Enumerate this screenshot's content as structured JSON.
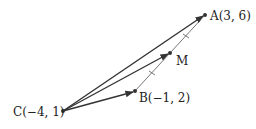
{
  "diagram": {
    "type": "vector-geometry",
    "points": [
      {
        "id": "A",
        "label": "A(3, 6)",
        "coords": [
          3,
          6
        ]
      },
      {
        "id": "B",
        "label": "B(−1, 2)",
        "coords": [
          -1,
          2
        ]
      },
      {
        "id": "C",
        "label": "C(−4, 1)",
        "coords": [
          -4,
          1
        ]
      },
      {
        "id": "M",
        "label": "M",
        "note": "midpoint of AB"
      }
    ],
    "vectors": [
      {
        "from": "C",
        "to": "A"
      },
      {
        "from": "C",
        "to": "M"
      },
      {
        "from": "C",
        "to": "B"
      }
    ],
    "segments": [
      {
        "from": "B",
        "to": "A",
        "style": "thin",
        "tick_marks": "equal halves BM = MA"
      }
    ],
    "colors": {
      "stroke": "#333333",
      "text": "#222222"
    }
  }
}
